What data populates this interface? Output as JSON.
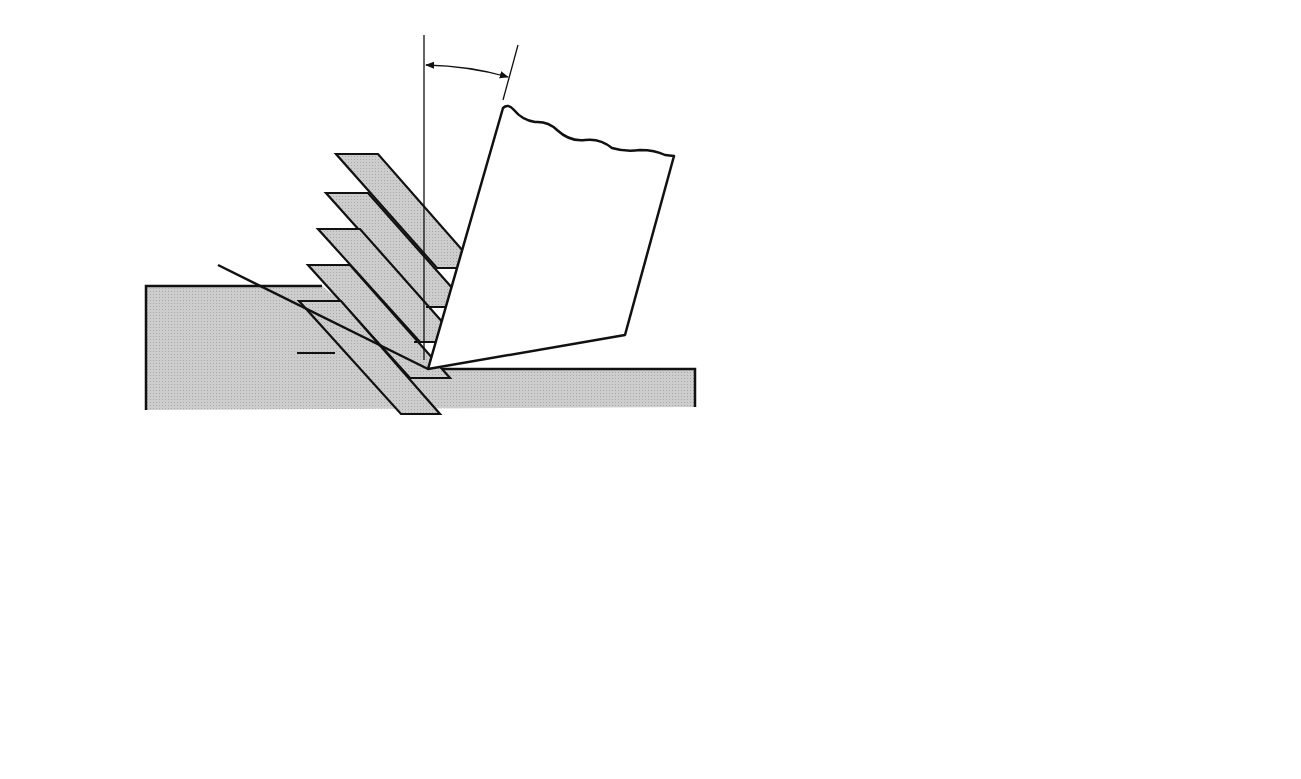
{
  "figure": {
    "panels": [
      {
        "id": "a",
        "caption": "(a)",
        "labels": {
          "chip": "Chip = parallel shear plates",
          "tool": "Tool",
          "shear_plane": "Shear plane",
          "rake_angle": "α",
          "shear_angle": "ϕ"
        },
        "plate_count": 6
      },
      {
        "id": "b",
        "caption": "(b)",
        "labels": {
          "thickness": "Thickness of plate",
          "magnitude": "Magnitude of strained material",
          "point_a": "A",
          "point_b": "B",
          "point_c": "C"
        }
      },
      {
        "id": "c",
        "caption": "(c)",
        "labels": {
          "point_a": "A",
          "point_b": "B",
          "point_c": "C",
          "point_d": "D",
          "angle_phi": "ϕ",
          "angle_phi_minus_alpha": "ϕ − α",
          "angle_alpha": "α"
        }
      }
    ],
    "colors": {
      "ink": "#111111",
      "fill_gray": "#c4c4c4",
      "background": "#ffffff"
    }
  }
}
